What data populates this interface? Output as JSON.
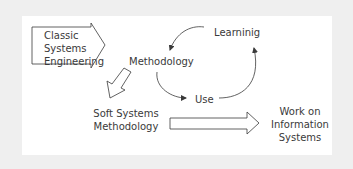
{
  "diagram": {
    "nodes": {
      "classic": "Classic\nSystems\nEngineering",
      "methodology": "Methodology",
      "learning": "Learninig",
      "use": "Use",
      "ssm": "Soft Systems\nMethodology",
      "work": "Work on\nInformation\nSystems"
    },
    "edges": [
      {
        "from": "Classic Systems Engineering",
        "to": "Methodology",
        "type": "block-arrow"
      },
      {
        "from": "Methodology",
        "to": "Soft Systems Methodology",
        "type": "block-arrow"
      },
      {
        "from": "Soft Systems Methodology",
        "to": "Work on Information Systems",
        "type": "block-arrow"
      },
      {
        "from": "Methodology",
        "to": "Use",
        "type": "curved-arrow"
      },
      {
        "from": "Use",
        "to": "Learninig",
        "type": "curved-arrow"
      },
      {
        "from": "Learninig",
        "to": "Methodology",
        "type": "curved-arrow"
      }
    ],
    "colors": {
      "background": "#efefef",
      "panel": "#ffffff",
      "stroke": "#3a3a3a"
    }
  }
}
